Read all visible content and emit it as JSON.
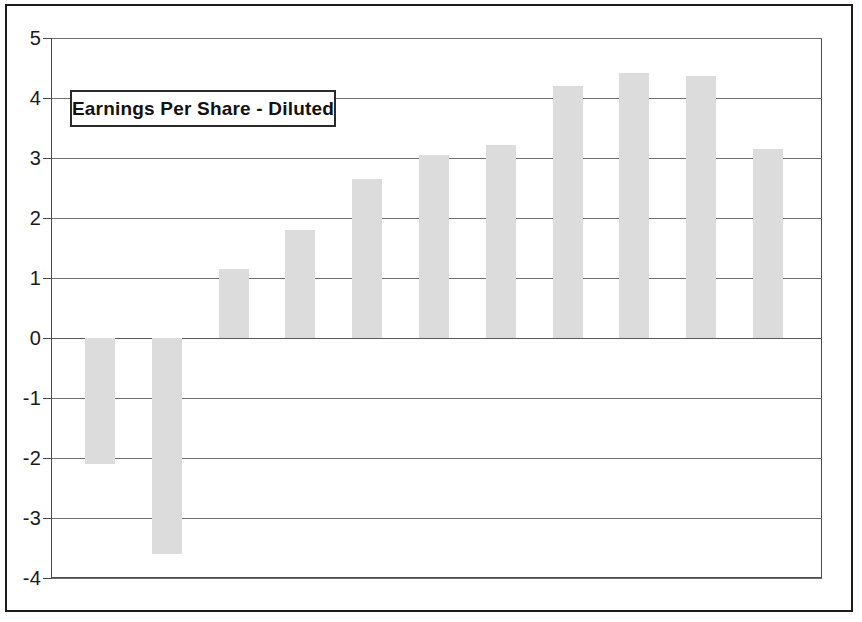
{
  "figure": {
    "frame_color": "#1c1c1c",
    "background": "#ffffff"
  },
  "title": {
    "label": "Earnings Per Share - Diluted"
  },
  "axis": {
    "y_tick_labels": [
      "5",
      "4",
      "3",
      "2",
      "1",
      "0",
      "-1",
      "-2",
      "-3",
      "-4"
    ]
  },
  "chart_data": {
    "type": "bar",
    "title": "Earnings Per Share - Diluted",
    "xlabel": "",
    "ylabel": "",
    "ylim": [
      -4,
      5
    ],
    "yticks": [
      5,
      4,
      3,
      2,
      1,
      0,
      -1,
      -2,
      -3,
      -4
    ],
    "grid": true,
    "legend": "none",
    "bar_color": "#dcdcdc",
    "categories": [
      "1",
      "2",
      "3",
      "4",
      "5",
      "6",
      "7",
      "8",
      "9",
      "10",
      "11"
    ],
    "values": [
      -2.1,
      -3.6,
      1.15,
      1.8,
      2.65,
      3.05,
      3.22,
      4.2,
      4.42,
      4.37,
      3.15
    ]
  }
}
